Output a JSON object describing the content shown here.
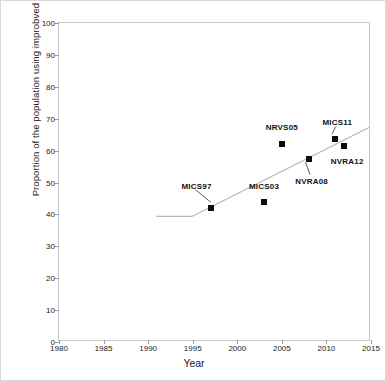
{
  "chart_data": {
    "type": "scatter",
    "title": "",
    "xlabel": "Year",
    "ylabel": "Proportion of the population using improbved sanitation  (%)",
    "xlim": [
      1980,
      2015
    ],
    "ylim": [
      0,
      100
    ],
    "xticks": [
      1980,
      1985,
      1990,
      1995,
      2000,
      2005,
      2010,
      2015
    ],
    "yticks": [
      0,
      10,
      20,
      30,
      40,
      50,
      60,
      70,
      80,
      90,
      100
    ],
    "grid": false,
    "legend": "none",
    "marker_color": "#0d0d0d",
    "trend_color": "#b4b4b4",
    "points": [
      {
        "label": "MICS97",
        "x": 1997,
        "y": 42,
        "label_dx": -14,
        "label_dy": -22,
        "leader": true
      },
      {
        "label": "MICS03",
        "x": 2003,
        "y": 44,
        "label_dx": 0,
        "label_dy": -16,
        "leader": false
      },
      {
        "label": "NRVS05",
        "x": 2005,
        "y": 62,
        "label_dx": 0,
        "label_dy": -17,
        "leader": false
      },
      {
        "label": "NVRA08",
        "x": 2008,
        "y": 57.5,
        "label_dx": 3,
        "label_dy": 22,
        "leader": true
      },
      {
        "label": "MICS11",
        "x": 2011,
        "y": 63.5,
        "label_dx": 2,
        "label_dy": -17,
        "leader": true
      },
      {
        "label": "NVRA12",
        "x": 2012,
        "y": 61.5,
        "label_dx": 3,
        "label_dy": 15,
        "leader": false
      }
    ],
    "trend_line": {
      "name": "JMP trend line",
      "x": [
        1991,
        1995,
        2015
      ],
      "y": [
        39,
        39,
        67
      ]
    }
  }
}
